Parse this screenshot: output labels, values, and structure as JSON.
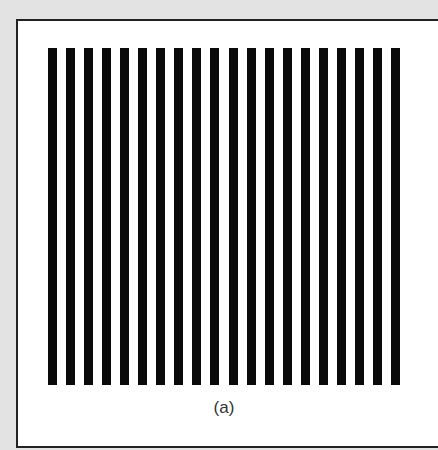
{
  "figure": {
    "caption": "(a)",
    "bar_count": 20,
    "bar_color": "#0a0a0a",
    "background_color": "#ffffff",
    "page_color": "#e3e3e3",
    "border_color": "#222222"
  }
}
